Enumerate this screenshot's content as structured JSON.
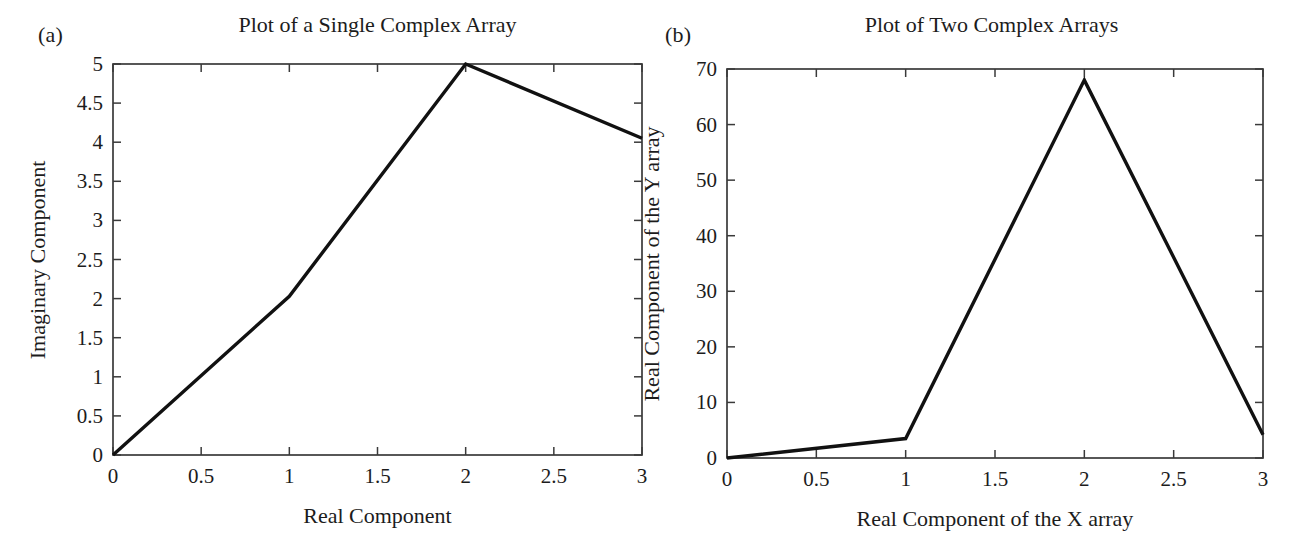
{
  "figure": {
    "panel_a_label": "(a)",
    "panel_b_label": "(b)"
  },
  "chart_data": [
    {
      "type": "line",
      "panel": "(a)",
      "title": "Plot of a Single Complex Array",
      "xlabel": "Real Component",
      "ylabel": "Imaginary Component",
      "xlim": [
        0,
        3
      ],
      "ylim": [
        0,
        5
      ],
      "grid": false,
      "legend": null,
      "xticks": [
        0,
        0.5,
        1,
        1.5,
        2,
        2.5,
        3
      ],
      "xticklabels": [
        "0",
        "0.5",
        "1",
        "1.5",
        "2",
        "2.5",
        "3"
      ],
      "yticks": [
        0,
        0.5,
        1,
        1.5,
        2,
        2.5,
        3,
        3.5,
        4,
        4.5,
        5
      ],
      "yticklabels": [
        "0",
        "0.5",
        "1",
        "1.5",
        "2",
        "2.5",
        "3",
        "3.5",
        "4",
        "4.5",
        "5"
      ],
      "series": [
        {
          "name": "complex array",
          "color": "#111111",
          "x": [
            0,
            1,
            2,
            3
          ],
          "y": [
            0,
            2.03,
            5,
            4.05
          ]
        }
      ]
    },
    {
      "type": "line",
      "panel": "(b)",
      "title": "Plot of Two Complex Arrays",
      "xlabel": "Real Component of the X array",
      "ylabel": "Real Component of the Y array",
      "xlim": [
        0,
        3
      ],
      "ylim": [
        0,
        70
      ],
      "grid": false,
      "legend": null,
      "xticks": [
        0,
        0.5,
        1,
        1.5,
        2,
        2.5,
        3
      ],
      "xticklabels": [
        "0",
        "0.5",
        "1",
        "1.5",
        "2",
        "2.5",
        "3"
      ],
      "yticks": [
        0,
        10,
        20,
        30,
        40,
        50,
        60,
        70
      ],
      "yticklabels": [
        "0",
        "10",
        "20",
        "30",
        "40",
        "50",
        "60",
        "70"
      ],
      "series": [
        {
          "name": "Y vs X",
          "color": "#111111",
          "x": [
            0,
            1,
            2,
            3
          ],
          "y": [
            0,
            3.5,
            68,
            4.2
          ]
        }
      ]
    }
  ]
}
